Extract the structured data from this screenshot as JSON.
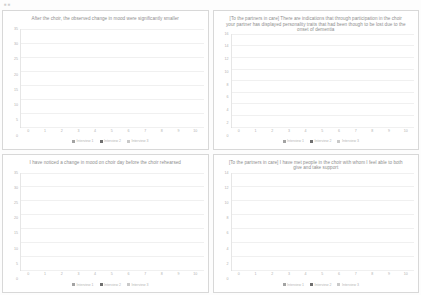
{
  "document": {
    "corner_mark": "▪▪",
    "legend_labels": [
      "Interview 1",
      "Interview 2",
      "Interview 3"
    ],
    "series_colors": [
      "#a3a3a3",
      "#6f6f6f",
      "#c9c9c9"
    ]
  },
  "chart_data": [
    {
      "type": "bar",
      "id": "chart-1",
      "title": "After the choir, the observed change in mood were significantly smaller",
      "xlabel": "",
      "ylabel": "",
      "categories": [
        "0",
        "1",
        "2",
        "3",
        "4",
        "5",
        "6",
        "7",
        "8",
        "9",
        "10"
      ],
      "yticks": [
        0,
        5,
        10,
        15,
        20,
        25,
        30,
        35
      ],
      "ylim": [
        0,
        35
      ],
      "grid": true,
      "legend_position": "bottom",
      "stacked": true,
      "series": [
        {
          "name": "Interview 1",
          "color": "#a3a3a3",
          "values": [
            0,
            0,
            0,
            0,
            0,
            0,
            0,
            0,
            0,
            0,
            0
          ]
        },
        {
          "name": "Interview 2",
          "color": "#6f6f6f",
          "values": [
            0,
            0,
            0,
            0,
            0,
            0,
            0,
            0,
            0,
            0,
            17
          ]
        },
        {
          "name": "Interview 3",
          "color": "#c9c9c9",
          "values": [
            0,
            0,
            0,
            0,
            0,
            0,
            0,
            0,
            0,
            0,
            15
          ]
        }
      ]
    },
    {
      "type": "bar",
      "id": "chart-2",
      "title": "[To the partners in care] There are indications that through participation in the choir your partner has displayed personality traits that had been though to be lost due to the onset of dementia",
      "xlabel": "",
      "ylabel": "",
      "categories": [
        "0",
        "1",
        "2",
        "3",
        "4",
        "5",
        "6",
        "7",
        "8",
        "9",
        "10"
      ],
      "yticks": [
        0,
        2,
        4,
        6,
        8,
        10,
        12,
        14,
        16
      ],
      "ylim": [
        0,
        16
      ],
      "grid": true,
      "legend_position": "bottom",
      "stacked": true,
      "series": [
        {
          "name": "Interview 1",
          "color": "#a3a3a3",
          "values": [
            0,
            0,
            2,
            0,
            0,
            0,
            1,
            0,
            0,
            1,
            0
          ]
        },
        {
          "name": "Interview 2",
          "color": "#6f6f6f",
          "values": [
            0,
            0,
            0,
            0,
            0,
            0,
            0,
            1,
            0,
            0,
            13
          ]
        },
        {
          "name": "Interview 3",
          "color": "#c9c9c9",
          "values": [
            0,
            0,
            0,
            0,
            0,
            0,
            0,
            0,
            0,
            0,
            2
          ]
        }
      ]
    },
    {
      "type": "bar",
      "id": "chart-3",
      "title": "I have noticed a change in mood on choir day before the choir rehearsed",
      "xlabel": "",
      "ylabel": "",
      "categories": [
        "0",
        "1",
        "2",
        "3",
        "4",
        "5",
        "6",
        "7",
        "8",
        "9",
        "10"
      ],
      "yticks": [
        0,
        5,
        10,
        15,
        20,
        25,
        30,
        35
      ],
      "ylim": [
        0,
        35
      ],
      "grid": true,
      "legend_position": "bottom",
      "stacked": true,
      "series": [
        {
          "name": "Interview 1",
          "color": "#a3a3a3",
          "values": [
            0,
            0,
            0,
            0,
            0,
            0,
            0,
            0,
            0,
            1,
            0
          ]
        },
        {
          "name": "Interview 2",
          "color": "#6f6f6f",
          "values": [
            0,
            0,
            0,
            0,
            0,
            0,
            2,
            0,
            0,
            0,
            19
          ]
        },
        {
          "name": "Interview 3",
          "color": "#c9c9c9",
          "values": [
            0,
            0,
            0,
            0,
            0,
            0,
            0,
            0,
            0,
            0,
            13
          ]
        }
      ]
    },
    {
      "type": "bar",
      "id": "chart-4",
      "title": "[To the partners in care] I have met people in the choir with whom I feel able to both give and take support",
      "xlabel": "",
      "ylabel": "",
      "categories": [
        "0",
        "1",
        "2",
        "3",
        "4",
        "5",
        "6",
        "7",
        "8",
        "9",
        "10"
      ],
      "yticks": [
        0,
        2,
        4,
        6,
        8,
        10,
        12,
        14
      ],
      "ylim": [
        0,
        14
      ],
      "grid": true,
      "legend_position": "bottom",
      "stacked": true,
      "series": [
        {
          "name": "Interview 1",
          "color": "#a3a3a3",
          "values": [
            0,
            0,
            0,
            0,
            0,
            0,
            0,
            0,
            0,
            2,
            0
          ]
        },
        {
          "name": "Interview 2",
          "color": "#6f6f6f",
          "values": [
            0,
            0,
            0,
            0,
            0,
            0,
            0,
            0,
            1,
            0,
            8
          ]
        },
        {
          "name": "Interview 3",
          "color": "#c9c9c9",
          "values": [
            0,
            0,
            0,
            0,
            0,
            0,
            0,
            0,
            0,
            0,
            5
          ]
        }
      ]
    }
  ]
}
